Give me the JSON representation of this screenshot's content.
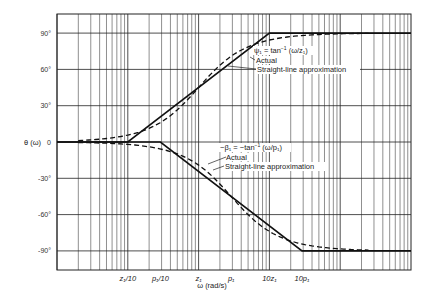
{
  "chart_data": {
    "type": "line",
    "title": "",
    "xlabel": "ω (rad/s)",
    "ylabel": "θ (ω)",
    "x_scale": "log",
    "x_decades": 5,
    "x_range_decades": [
      0,
      5
    ],
    "xlim_note": "z1/10 at decade 1; z1 at decade 2; 10z1 at decade 3",
    "p1_over_z1": 2.9,
    "x_ticks": [
      {
        "label": "z₁/10",
        "log_pos": 1.0
      },
      {
        "label": "p₁/10",
        "log_pos": 1.46
      },
      {
        "label": "z₁",
        "log_pos": 2.0
      },
      {
        "label": "p₁",
        "log_pos": 2.46
      },
      {
        "label": "10z₁",
        "log_pos": 3.0
      },
      {
        "label": "10p₁",
        "log_pos": 3.46
      }
    ],
    "y_ticks": [
      {
        "value": 90,
        "label": "90°"
      },
      {
        "value": 60,
        "label": "60°"
      },
      {
        "value": 30,
        "label": "30°"
      },
      {
        "value": 0,
        "label": "0"
      },
      {
        "value": -30,
        "label": "-30°"
      },
      {
        "value": -60,
        "label": "-60°"
      },
      {
        "value": -90,
        "label": "-90°"
      }
    ],
    "ylim": [
      -105,
      105
    ],
    "grid": true,
    "series": [
      {
        "name": "ψ1 straight-line approximation",
        "style": "solid",
        "breakpoints_log": [
          [
            0,
            0
          ],
          [
            1.0,
            0
          ],
          [
            3.0,
            90
          ],
          [
            5,
            90
          ]
        ]
      },
      {
        "name": "ψ1 actual",
        "style": "dashed",
        "function": "atan",
        "corner_log": 2.0,
        "sign": 1
      },
      {
        "name": "β1 straight-line approximation",
        "style": "solid",
        "breakpoints_log": [
          [
            0,
            0
          ],
          [
            1.46,
            0
          ],
          [
            3.46,
            -90
          ],
          [
            5,
            -90
          ]
        ]
      },
      {
        "name": "β1 actual",
        "style": "dashed",
        "function": "atan",
        "corner_log": 2.46,
        "sign": -1
      }
    ],
    "annotations": {
      "psi": {
        "eq_lhs": "ψ₁ = tan",
        "eq_sup": "−1",
        "eq_rhs": " (ω/z₁)",
        "actual": "Actual",
        "approx": "Straight-line approximation"
      },
      "beta": {
        "eq_lhs": "−β₁ = −tan",
        "eq_sup": "−1",
        "eq_rhs": " (ω/p₁)",
        "actual": "Actual",
        "approx": "Straight-line approximation"
      }
    },
    "y_axis_title": "θ (ω)"
  }
}
